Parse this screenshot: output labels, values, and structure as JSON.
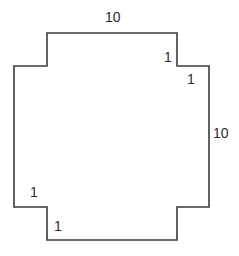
{
  "diagram": {
    "type": "stepped-polygon",
    "stroke_color": "#3a3a3a",
    "background": "#ffffff",
    "labels": {
      "top": "10",
      "right": "10",
      "top_right_step_vertical": "1",
      "top_right_step_horizontal": "1",
      "bottom_left_step_vertical": "1",
      "bottom_left_step_horizontal": "1"
    }
  }
}
